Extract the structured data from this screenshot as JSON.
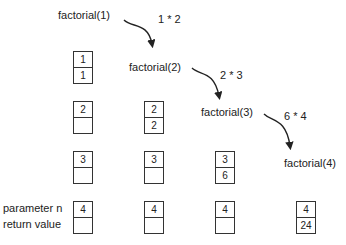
{
  "calls": [
    {
      "label": "factorial(1)",
      "x": 58,
      "y": 9
    },
    {
      "label": "factorial(2)",
      "x": 129,
      "y": 61
    },
    {
      "label": "factorial(3)",
      "x": 201,
      "y": 106
    },
    {
      "label": "factorial(4)",
      "x": 284,
      "y": 157
    }
  ],
  "products": [
    {
      "label": "1 * 2",
      "x": 158,
      "y": 13
    },
    {
      "label": "2 * 3",
      "x": 220,
      "y": 69
    },
    {
      "label": "6 * 4",
      "x": 284,
      "y": 110
    }
  ],
  "legend": {
    "param": "parameter n",
    "ret": "return value"
  },
  "stacks": [
    {
      "x": 73,
      "frames": [
        {
          "y": 51,
          "n": "1",
          "r": "1"
        },
        {
          "y": 101,
          "n": "2",
          "r": ""
        },
        {
          "y": 151,
          "n": "3",
          "r": ""
        },
        {
          "y": 201,
          "n": "4",
          "r": ""
        }
      ]
    },
    {
      "x": 144,
      "frames": [
        {
          "y": 101,
          "n": "2",
          "r": "2"
        },
        {
          "y": 151,
          "n": "3",
          "r": ""
        },
        {
          "y": 201,
          "n": "4",
          "r": ""
        }
      ]
    },
    {
      "x": 215,
      "frames": [
        {
          "y": 151,
          "n": "3",
          "r": "6"
        },
        {
          "y": 201,
          "n": "4",
          "r": ""
        }
      ]
    },
    {
      "x": 296,
      "frames": [
        {
          "y": 201,
          "n": "4",
          "r": "24"
        }
      ]
    }
  ]
}
